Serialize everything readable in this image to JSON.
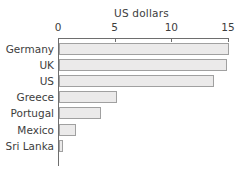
{
  "chart_data": {
    "type": "bar",
    "orientation": "horizontal",
    "title": "",
    "xlabel": "US dollars",
    "ylabel": "",
    "categories": [
      "Germany",
      "UK",
      "US",
      "Greece",
      "Portugal",
      "Mexico",
      "Sri Lanka"
    ],
    "values": [
      15.0,
      14.8,
      13.7,
      5.1,
      3.7,
      1.5,
      0.35
    ],
    "xlim": [
      0,
      15
    ],
    "xticks": [
      0,
      5,
      10,
      15
    ],
    "xticklabels": [
      "0",
      "5",
      "10",
      "15"
    ],
    "grid": false,
    "legend": null,
    "axis_title_position": "top",
    "colors": {
      "bar_fill": "#ebeaea",
      "bar_edge": "#a0a0a0",
      "axis": "#6e6e6e",
      "text": "#3d3d3d",
      "background": "#ffffff"
    }
  }
}
